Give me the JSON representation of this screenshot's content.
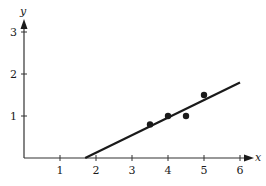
{
  "chart_data": {
    "type": "scatter",
    "title": "",
    "xlabel": "x",
    "ylabel": "y",
    "xlim": [
      0,
      6
    ],
    "ylim": [
      0,
      3
    ],
    "grid": false,
    "legend": null,
    "x_ticks": [
      1,
      2,
      3,
      4,
      5,
      6
    ],
    "y_ticks": [
      1,
      2,
      3
    ],
    "x_tick_labels": [
      "1",
      "2",
      "3",
      "4",
      "5",
      "6"
    ],
    "y_tick_labels": [
      "1",
      "2",
      "3"
    ],
    "series": [
      {
        "name": "data points",
        "type": "scatter",
        "points": [
          {
            "x": 3.5,
            "y": 0.8
          },
          {
            "x": 4.0,
            "y": 1.0
          },
          {
            "x": 4.5,
            "y": 1.0
          },
          {
            "x": 5.0,
            "y": 1.5
          }
        ]
      },
      {
        "name": "fitted line",
        "type": "line",
        "points": [
          {
            "x": 1.7,
            "y": 0.0
          },
          {
            "x": 6.0,
            "y": 1.8
          }
        ]
      }
    ]
  },
  "colors": {
    "ink": "#1a1a1a",
    "background": "#ffffff"
  }
}
